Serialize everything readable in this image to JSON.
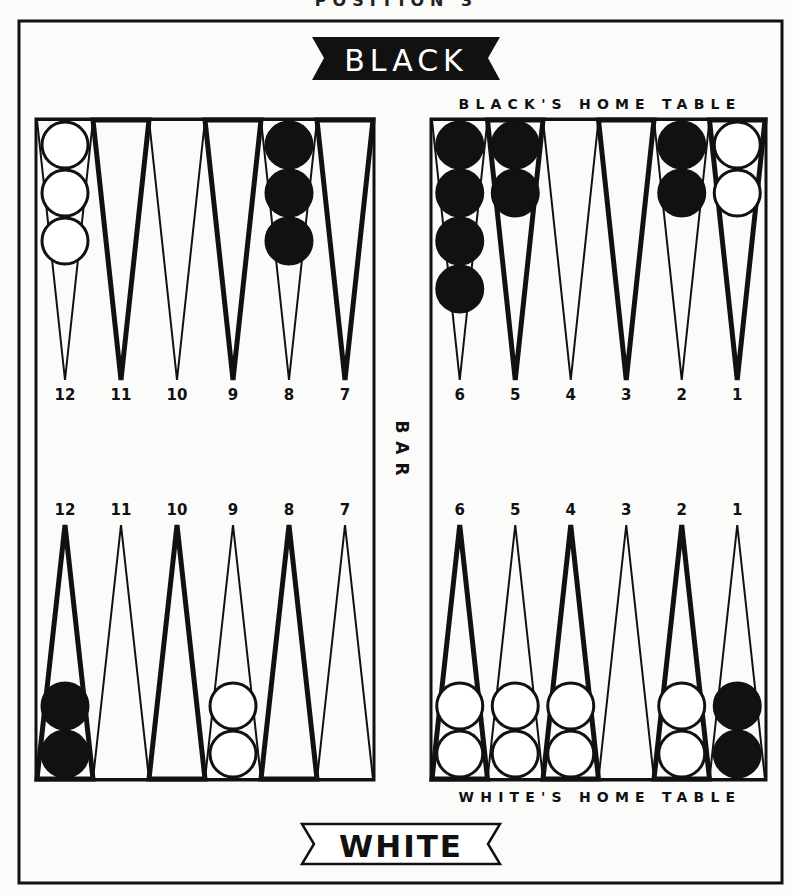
{
  "caption": "POSITION 3",
  "banners": {
    "top": {
      "label": "BLACK",
      "fill": "#111111",
      "text_color": "#ffffff"
    },
    "bottom": {
      "label": "WHITE",
      "fill": "#ffffff",
      "text_color": "#111111"
    }
  },
  "home_labels": {
    "top": "BLACK'S HOME TABLE",
    "bottom": "WHITE'S HOME TABLE"
  },
  "bar_label": "BAR",
  "colors": {
    "ink": "#111111",
    "paper": "#fbfbfa",
    "white_checker": "#ffffff",
    "black_checker": "#111111"
  },
  "point_labels": {
    "top_left": [
      "12",
      "11",
      "10",
      "9",
      "8",
      "7"
    ],
    "top_right": [
      "6",
      "5",
      "4",
      "3",
      "2",
      "1"
    ],
    "bottom_left": [
      "12",
      "11",
      "10",
      "9",
      "8",
      "7"
    ],
    "bottom_right": [
      "6",
      "5",
      "4",
      "3",
      "2",
      "1"
    ]
  },
  "position": {
    "top": [
      {
        "point": "12",
        "quadrant": "top_left",
        "color": "white",
        "count": 3
      },
      {
        "point": "8",
        "quadrant": "top_left",
        "color": "black",
        "count": 3
      },
      {
        "point": "6",
        "quadrant": "top_right",
        "color": "black",
        "count": 4
      },
      {
        "point": "5",
        "quadrant": "top_right",
        "color": "black",
        "count": 2
      },
      {
        "point": "2",
        "quadrant": "top_right",
        "color": "black",
        "count": 2
      },
      {
        "point": "1",
        "quadrant": "top_right",
        "color": "white",
        "count": 2
      }
    ],
    "bottom": [
      {
        "point": "12",
        "quadrant": "bottom_left",
        "color": "black",
        "count": 2
      },
      {
        "point": "9",
        "quadrant": "bottom_left",
        "color": "white",
        "count": 2
      },
      {
        "point": "6",
        "quadrant": "bottom_right",
        "color": "white",
        "count": 2
      },
      {
        "point": "5",
        "quadrant": "bottom_right",
        "color": "white",
        "count": 2
      },
      {
        "point": "4",
        "quadrant": "bottom_right",
        "color": "white",
        "count": 2
      },
      {
        "point": "2",
        "quadrant": "bottom_right",
        "color": "white",
        "count": 2
      },
      {
        "point": "1",
        "quadrant": "bottom_right",
        "color": "black",
        "count": 2
      }
    ]
  }
}
